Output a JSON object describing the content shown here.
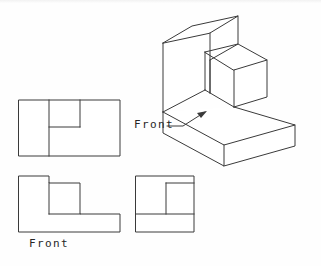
{
  "drawing": {
    "title": "Orthographic Projection with Isometric Pictorial",
    "sheet": {
      "width": 321,
      "height": 266,
      "background": "#fefefe"
    },
    "line_color": "#3a3a3a",
    "text_color": "#262626"
  },
  "labels": {
    "front_iso": "Front",
    "front_view": "Front"
  },
  "views": {
    "top": {
      "name": "Top View",
      "outline": "19,100 120,100 120,156 19,156",
      "internal_lines": [
        "49,100 49,156",
        "80,100 80,127",
        "49,127 80,127"
      ]
    },
    "front": {
      "name": "Front View",
      "outline": "19,176 49,176 49,183 80,183 80,214 120,214 120,232 19,232",
      "internal_lines": [
        "49,183 49,214",
        "49,214 80,214"
      ]
    },
    "side": {
      "name": "Right Side View",
      "outline": "136,176 194,176 194,232 136,232",
      "internal_lines": [
        "136,214 194,214",
        "166,183 194,183",
        "166,183 166,214"
      ]
    },
    "isometric": {
      "name": "Isometric Pictorial",
      "faces": [
        {
          "id": "upper-left-top",
          "points": "163,43 192,26 238,16 210,33"
        },
        {
          "id": "upper-left-front",
          "points": "163,43 210,33 210,60 163,71"
        },
        {
          "id": "upper-left-right",
          "points": "210,33 238,16 238,44 210,60"
        },
        {
          "id": "upper-left-side-lower",
          "points": "163,71 210,60 210,93 163,112"
        },
        {
          "id": "middle-block-top",
          "points": "205,52 238,44 267,60 234,70"
        },
        {
          "id": "middle-block-front",
          "points": "205,52 205,90 234,107 234,70"
        },
        {
          "id": "middle-block-right",
          "points": "234,70 267,60 267,97 234,107"
        },
        {
          "id": "base-top",
          "points": "163,112 234,107 295,125 224,145"
        },
        {
          "id": "base-front",
          "points": "163,112 163,133 224,166 224,145"
        },
        {
          "id": "base-right",
          "points": "224,145 295,125 295,146 224,166"
        }
      ],
      "edges": [
        "163,43 192,26",
        "192,26 238,16",
        "238,16 210,33",
        "210,33 163,43",
        "163,43 163,112",
        "210,33 210,93",
        "238,16 238,44",
        "238,44 210,60",
        "210,60 210,93",
        "205,52 238,44",
        "205,52 205,90",
        "238,44 267,60",
        "267,60 234,70",
        "234,70 205,52",
        "234,70 234,107",
        "267,60 267,97",
        "267,97 234,107",
        "205,90 234,107",
        "163,112 205,90",
        "234,107 295,125",
        "295,125 224,145",
        "224,145 163,112",
        "163,112 163,133",
        "163,133 224,166",
        "224,166 224,145",
        "224,166 295,146",
        "295,146 295,125"
      ],
      "leader": {
        "line": "167,126 183,126 207,111",
        "arrow_tip": "207,111",
        "points_to": "front-face-of-base"
      }
    }
  }
}
